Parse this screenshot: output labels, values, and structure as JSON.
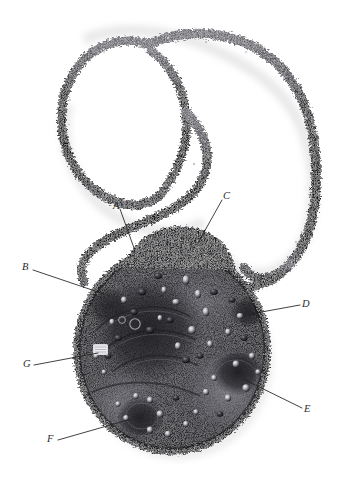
{
  "figure": {
    "background_color": "#ffffff",
    "width": 337,
    "height": 486
  },
  "palette": {
    "background": "#ffffff",
    "label_text": "#2b2b2b",
    "leader_line": "#231f20",
    "cord_dark": "#1b1b1d",
    "cord_mid": "#4a4a50",
    "cord_light": "#9a9aa2",
    "pendant_dark": "#141416",
    "pendant_mid": "#3c3c42",
    "pendant_light": "#b9b9bf",
    "bead_highlight": "#e4e4e8",
    "shadow": "#d8d8da"
  },
  "callouts": [
    {
      "id": "A",
      "label": "A",
      "label_x": 113,
      "label_y": 201,
      "line": {
        "x1": 120,
        "y1": 209,
        "x2": 134,
        "y2": 248
      },
      "target_region": "upper-centre-left beaded cluster of pendant"
    },
    {
      "id": "B",
      "label": "B",
      "label_x": 22,
      "label_y": 262,
      "line": {
        "x1": 33,
        "y1": 270,
        "x2": 104,
        "y2": 294
      },
      "target_region": "left upper edge of pendant"
    },
    {
      "id": "C",
      "label": "C",
      "label_x": 223,
      "label_y": 191,
      "line": {
        "x1": 222,
        "y1": 200,
        "x2": 198,
        "y2": 243
      },
      "target_region": "top crocheted crest of pendant"
    },
    {
      "id": "D",
      "label": "D",
      "label_x": 302,
      "label_y": 299,
      "line": {
        "x1": 300,
        "y1": 305,
        "x2": 245,
        "y2": 315
      },
      "target_region": "right side dark bead pocket"
    },
    {
      "id": "E",
      "label": "E",
      "label_x": 304,
      "label_y": 404,
      "line": {
        "x1": 302,
        "y1": 408,
        "x2": 245,
        "y2": 380
      },
      "target_region": "lower right beaded rosette border"
    },
    {
      "id": "F",
      "label": "F",
      "label_x": 47,
      "label_y": 434,
      "line": {
        "x1": 58,
        "y1": 440,
        "x2": 128,
        "y2": 420
      },
      "target_region": "bottom left spiral of pendant"
    },
    {
      "id": "G",
      "label": "G",
      "label_x": 23,
      "label_y": 359,
      "line": {
        "x1": 34,
        "y1": 365,
        "x2": 98,
        "y2": 353
      },
      "target_region": "pale rectangular stone on left of pendant"
    }
  ]
}
